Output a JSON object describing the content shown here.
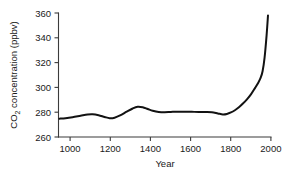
{
  "chart_data": {
    "type": "line",
    "title": "",
    "xlabel": "Year",
    "ylabel": "CO2 concentration (ppbv)",
    "ylabel_main": "concentration (ppbv)",
    "ylabel_prefix": "CO",
    "ylabel_sub": "2",
    "xlim": [
      950,
      2010
    ],
    "ylim": [
      260,
      360
    ],
    "xticks": [
      1000,
      1200,
      1400,
      1600,
      1800,
      2000
    ],
    "xtick_labels": [
      "1000",
      "1200",
      "1400",
      "1600",
      "1800",
      "2000"
    ],
    "yticks": [
      260,
      280,
      300,
      320,
      340,
      360
    ],
    "ytick_labels": [
      "260",
      "280",
      "300",
      "320",
      "340",
      "360"
    ],
    "grid": false,
    "legend": null,
    "series": [
      {
        "name": "CO2 concentration",
        "color": "#121212",
        "x": [
          955,
          985,
          1020,
          1060,
          1095,
          1120,
          1150,
          1180,
          1205,
          1230,
          1260,
          1290,
          1320,
          1345,
          1370,
          1395,
          1420,
          1450,
          1480,
          1510,
          1545,
          1580,
          1615,
          1650,
          1685,
          1715,
          1745,
          1770,
          1790,
          1810,
          1830,
          1850,
          1870,
          1890,
          1910,
          1930,
          1945,
          1958,
          1968,
          1978,
          1988,
          1995
        ],
        "y": [
          274.8,
          275.2,
          276.0,
          277.2,
          278.2,
          278.4,
          277.6,
          276.2,
          275.2,
          275.6,
          277.6,
          280.4,
          283.0,
          284.4,
          284.0,
          282.6,
          281.2,
          280.2,
          280.0,
          280.2,
          280.4,
          280.4,
          280.3,
          280.2,
          280.2,
          280.0,
          279.0,
          278.2,
          278.6,
          279.8,
          281.6,
          284.0,
          287.0,
          290.4,
          294.4,
          299.4,
          303.4,
          307.6,
          313.0,
          324.0,
          342.0,
          358.0
        ]
      }
    ]
  },
  "axis": {
    "x_title": "Year",
    "y_title_prefix": "CO",
    "y_title_sub": "2",
    "y_title_rest": " concentration (ppbv)"
  }
}
